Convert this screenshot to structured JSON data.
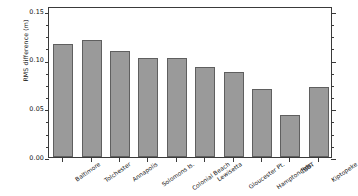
{
  "chart_data": {
    "type": "bar",
    "title": "",
    "subtitle": "",
    "xlabel": "",
    "ylabel": "RMS difference (m)",
    "categories": [
      "Baltimore",
      "Tolchester",
      "Annapolis",
      "Solomons Is.",
      "Colonial Beach",
      "Lewisetta",
      "Gloucester Pt.",
      "Hampton Rds.",
      "CBBT",
      "Kiptopeke"
    ],
    "values": [
      0.116,
      0.12,
      0.109,
      0.102,
      0.102,
      0.092,
      0.087,
      0.07,
      0.043,
      0.072
    ],
    "ylim": [
      0.0,
      0.155
    ],
    "yticks": [
      0.0,
      0.05,
      0.1,
      0.15
    ],
    "ytick_labels": [
      "0.00",
      "0.05",
      "0.10",
      "0.15"
    ],
    "yminor_step": 0.0125,
    "grid": false,
    "legend": null,
    "bar_color": "#9a9a9a",
    "bar_edge_color": "#5f5f5f",
    "axis_color": "#3a3a3a",
    "background_color": "#ffffff"
  }
}
